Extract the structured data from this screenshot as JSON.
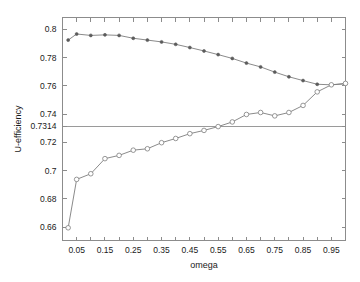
{
  "chart_data": {
    "type": "line",
    "title": "",
    "xlabel": "omega",
    "ylabel": "U-efficiency",
    "xlim": [
      0.0,
      1.0
    ],
    "ylim": [
      0.6505,
      0.8085
    ],
    "grid": false,
    "legend": "none",
    "x_ticks": [
      0.05,
      0.15,
      0.25,
      0.35,
      0.45,
      0.55,
      0.65,
      0.75,
      0.85,
      0.95
    ],
    "x_tick_labels": [
      "0.05",
      "0.15",
      "0.25",
      "0.35",
      "0.45",
      "0.55",
      "0.65",
      "0.75",
      "0.85",
      "0.95"
    ],
    "x_minor_ticks": [
      0.1,
      0.2,
      0.3,
      0.4,
      0.5,
      0.6,
      0.7,
      0.8,
      0.9,
      1.0
    ],
    "y_ticks": [
      0.66,
      0.68,
      0.7,
      0.72,
      0.7314,
      0.74,
      0.76,
      0.78,
      0.8
    ],
    "y_tick_labels": [
      "0.66",
      "0.68",
      "0.7",
      "0.72",
      "0.7314",
      "0.74",
      "0.76",
      "0.78",
      "0.8"
    ],
    "reference_lines": [
      {
        "name": "u-efficiency-threshold",
        "orientation": "horizontal",
        "value": 0.7314,
        "label": "0.7314"
      }
    ],
    "x": [
      0.02,
      0.05,
      0.1,
      0.15,
      0.2,
      0.25,
      0.3,
      0.35,
      0.4,
      0.45,
      0.5,
      0.55,
      0.6,
      0.65,
      0.7,
      0.75,
      0.8,
      0.85,
      0.9,
      0.95,
      1.0
    ],
    "series": [
      {
        "name": "upper-curve",
        "marker": "filled-circle",
        "values": [
          0.7925,
          0.7968,
          0.7958,
          0.7962,
          0.7958,
          0.7938,
          0.7925,
          0.7912,
          0.7895,
          0.7872,
          0.7848,
          0.7822,
          0.7795,
          0.7762,
          0.7735,
          0.7698,
          0.7665,
          0.7638,
          0.7612,
          0.7608,
          0.7615
        ]
      },
      {
        "name": "lower-curve",
        "marker": "open-circle",
        "values": [
          0.6595,
          0.6938,
          0.6978,
          0.7085,
          0.7108,
          0.7145,
          0.7155,
          0.7198,
          0.7228,
          0.7262,
          0.7285,
          0.7312,
          0.7345,
          0.7398,
          0.7412,
          0.7388,
          0.7412,
          0.7462,
          0.7558,
          0.7608,
          0.7618
        ]
      }
    ]
  }
}
